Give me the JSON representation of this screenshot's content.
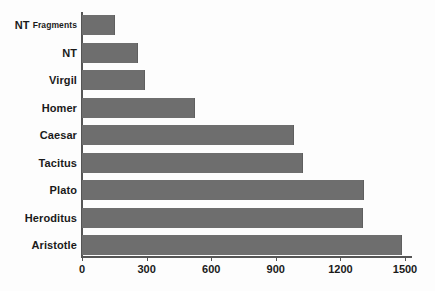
{
  "chart_data": {
    "type": "bar",
    "orientation": "horizontal",
    "title": "",
    "xlabel": "",
    "ylabel": "",
    "xlim": [
      0,
      1500
    ],
    "xticks": [
      0,
      300,
      600,
      900,
      1200,
      1500
    ],
    "xtick_labels": [
      "0",
      "300",
      "600",
      "900",
      "1200",
      "1500"
    ],
    "grid": false,
    "legend": false,
    "bar_color": "#6e6e6e",
    "axis_color": "#555555",
    "background_color": "#fdfdfd",
    "categories": [
      "NT Fragments",
      "NT",
      "Virgil",
      "Homer",
      "Caesar",
      "Tacitus",
      "Plato",
      "Heroditus",
      "Aristotle"
    ],
    "values": [
      150,
      255,
      290,
      520,
      980,
      1020,
      1305,
      1300,
      1480
    ],
    "bars": [
      {
        "label_main": "NT",
        "label_sub": "Fragments",
        "value": 150
      },
      {
        "label_main": "NT",
        "label_sub": "",
        "value": 255
      },
      {
        "label_main": "Virgil",
        "label_sub": "",
        "value": 290
      },
      {
        "label_main": "Homer",
        "label_sub": "",
        "value": 520
      },
      {
        "label_main": "Caesar",
        "label_sub": "",
        "value": 980
      },
      {
        "label_main": "Tacitus",
        "label_sub": "",
        "value": 1020
      },
      {
        "label_main": "Plato",
        "label_sub": "",
        "value": 1305
      },
      {
        "label_main": "Heroditus",
        "label_sub": "",
        "value": 1300
      },
      {
        "label_main": "Aristotle",
        "label_sub": "",
        "value": 1480
      }
    ]
  }
}
